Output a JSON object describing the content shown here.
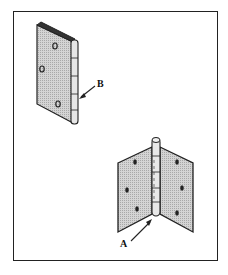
{
  "diagram": {
    "type": "technical illustration",
    "figures": [
      {
        "name": "closed-hinge",
        "description": "Single leaf butt hinge viewed folded, knuckle on right",
        "label": "B",
        "label_points_to": "knuckle/barrel joint"
      },
      {
        "name": "open-hinge",
        "description": "Butt hinge opened with two leaves, each with three screw holes",
        "label": "A",
        "label_points_to": "bottom of hinge pin"
      }
    ],
    "labels": {
      "a": "A",
      "b": "B"
    },
    "colors": {
      "leaf_fill": "#c8c8c8",
      "stroke": "#222222",
      "frame": "#222222",
      "background": "#ffffff"
    }
  }
}
